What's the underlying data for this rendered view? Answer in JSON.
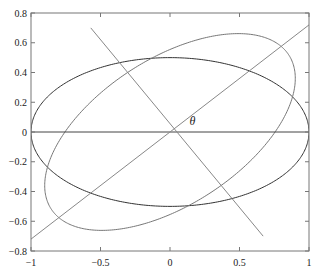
{
  "chart_data": {
    "type": "line",
    "title": "",
    "xlabel": "",
    "ylabel": "",
    "xlim": [
      -1,
      1
    ],
    "ylim": [
      -0.8,
      0.8
    ],
    "grid": false,
    "legend": null,
    "x_ticks": [
      -1,
      -0.5,
      0,
      0.5,
      1
    ],
    "x_tick_labels": [
      "−1",
      "−0.5",
      "0",
      "0.5",
      "1"
    ],
    "y_ticks": [
      0.8,
      0.6,
      0.4,
      0.2,
      0,
      -0.2,
      -0.4,
      -0.6,
      -0.8
    ],
    "y_tick_labels": [
      "0.8",
      "0.6",
      "0.4",
      "0.2",
      "0",
      "−0.2",
      "−0.4",
      "−0.6",
      "−0.8"
    ],
    "series": [
      {
        "name": "axis-aligned ellipse",
        "kind": "ellipse",
        "center": [
          0,
          0
        ],
        "a": 1.0,
        "b": 0.5,
        "rotation_deg": 0,
        "color": "#333333"
      },
      {
        "name": "rotated ellipse",
        "kind": "ellipse",
        "center": [
          0,
          0
        ],
        "a": 1.0,
        "b": 0.5,
        "rotation_deg": 30,
        "color": "#777777"
      },
      {
        "name": "horizontal axis line",
        "kind": "segment",
        "x": [
          -1,
          1
        ],
        "y": [
          0,
          0
        ],
        "color": "#444444"
      },
      {
        "name": "rotated major axis",
        "kind": "segment",
        "x": [
          -1,
          1
        ],
        "y": [
          -0.72,
          0.72
        ],
        "color": "#888888"
      },
      {
        "name": "rotated minor axis",
        "kind": "segment",
        "x": [
          -0.57,
          0.67
        ],
        "y": [
          0.7,
          -0.7
        ],
        "color": "#888888"
      }
    ],
    "annotations": [
      {
        "text": "θ",
        "x": 0.14,
        "y": 0.05
      }
    ]
  }
}
